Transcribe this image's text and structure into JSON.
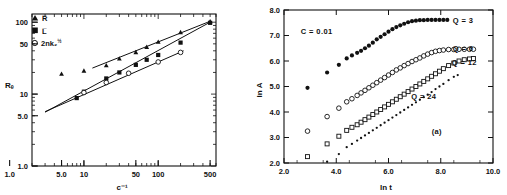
{
  "figure": {
    "background": "#ffffff",
    "ink": "#111111"
  },
  "panels": [
    {
      "id": "left",
      "name": "radius-vs-inverse-concentration",
      "chart_data": {
        "type": "scatter",
        "title": "",
        "xlabel": "c⁻¹",
        "ylabel": "Rₑ",
        "xscale": "log",
        "yscale": "log",
        "xlim": [
          2.0,
          600
        ],
        "ylim": [
          1.0,
          130
        ],
        "grid": false,
        "legend_position": "top-left",
        "xticks": [
          "1.0",
          "5.0",
          "10",
          "50",
          "100",
          "500"
        ],
        "xtick_values": [
          1.0,
          5.0,
          10,
          50,
          100,
          500
        ],
        "yticks": [
          "1.0",
          "5.0",
          "10",
          "50",
          "100"
        ],
        "ytick_values": [
          1.0,
          5.0,
          10,
          50,
          100
        ],
        "series": [
          {
            "name": "R̅",
            "marker": "filled-triangle",
            "x": [
              5.0,
              10.0,
              20.0,
              30.0,
              50.0,
              70.0,
              100.0,
              200.0,
              500.0
            ],
            "y": [
              19.0,
              21.0,
              25.0,
              31.0,
              38.0,
              45.0,
              53.0,
              72.0,
              102.0
            ],
            "fit_line": {
              "x": [
                13.0,
                500.0
              ],
              "y": [
                23.0,
                103.0
              ]
            }
          },
          {
            "name": "L̅",
            "marker": "filled-square",
            "x": [
              8.0,
              10.0,
              20.0,
              30.0,
              50.0,
              70.0,
              100.0,
              200.0,
              500.0
            ],
            "y": [
              8.8,
              10.8,
              16.5,
              20.0,
              25.5,
              30.0,
              35.0,
              52.0,
              98.0
            ],
            "fit_line": {
              "x": [
                3.0,
                500.0
              ],
              "y": [
                5.6,
                100.0
              ]
            }
          },
          {
            "name": "2nk₂",
            "name_exponent": "½",
            "marker": "open-circle",
            "x": [
              10.0,
              20.0,
              40.0,
              100.0,
              200.0
            ],
            "y": [
              10.5,
              14.5,
              19.5,
              28.0,
              38.0
            ],
            "fit_line": {
              "x": [
                3.0,
                220.0
              ],
              "y": [
                5.7,
                40.0
              ]
            }
          }
        ]
      }
    },
    {
      "id": "right",
      "name": "ln-a-vs-ln-t",
      "chart_data": {
        "type": "scatter",
        "title": "",
        "xlabel": "ln t",
        "ylabel": "ln A",
        "xscale": "linear",
        "yscale": "linear",
        "xlim": [
          2.0,
          10.0
        ],
        "ylim": [
          2.0,
          8.0
        ],
        "grid": false,
        "legend_position": "inline-right",
        "xticks": [
          "2.0",
          "4.0",
          "6.0",
          "8.0",
          "10.0"
        ],
        "xtick_values": [
          2.0,
          4.0,
          6.0,
          8.0,
          10.0
        ],
        "yticks": [
          "2.0",
          "3.0",
          "4.0",
          "5.0",
          "6.0",
          "7.0",
          "8.0"
        ],
        "ytick_values": [
          2.0,
          3.0,
          4.0,
          5.0,
          6.0,
          7.0,
          8.0
        ],
        "annotations": [
          {
            "text": "C = 0.01",
            "x": 3.25,
            "y": 7.05
          },
          {
            "text": "(a)",
            "x": 7.85,
            "y": 3.15
          }
        ],
        "series": [
          {
            "name": "Q = 3",
            "label": "Q = 3",
            "marker": "filled-circle",
            "label_x": 8.85,
            "label_y": 7.62,
            "x": [
              2.9,
              3.65,
              4.1,
              4.4,
              4.6,
              4.8,
              4.95,
              5.1,
              5.25,
              5.4,
              5.55,
              5.7,
              5.85,
              6.0,
              6.15,
              6.3,
              6.45,
              6.6,
              6.75,
              6.9,
              7.05,
              7.2,
              7.35,
              7.5,
              7.65,
              7.8,
              7.95,
              8.1,
              8.25
            ],
            "y": [
              4.95,
              5.55,
              5.85,
              6.1,
              6.22,
              6.32,
              6.4,
              6.5,
              6.6,
              6.72,
              6.85,
              6.95,
              7.05,
              7.15,
              7.25,
              7.33,
              7.4,
              7.46,
              7.52,
              7.56,
              7.58,
              7.6,
              7.6,
              7.61,
              7.61,
              7.61,
              7.61,
              7.61,
              7.61
            ]
          },
          {
            "name": "Q = 6",
            "label": "Q = 6",
            "marker": "open-circle",
            "label_x": 8.85,
            "label_y": 6.52,
            "x": [
              2.9,
              3.65,
              4.1,
              4.4,
              4.6,
              4.8,
              4.95,
              5.1,
              5.25,
              5.4,
              5.55,
              5.7,
              5.85,
              6.0,
              6.15,
              6.3,
              6.45,
              6.6,
              6.75,
              6.9,
              7.05,
              7.2,
              7.35,
              7.5,
              7.65,
              7.8,
              7.95,
              8.1,
              8.3,
              8.5,
              8.7,
              8.9,
              9.1,
              9.25
            ],
            "y": [
              3.25,
              3.82,
              4.15,
              4.4,
              4.52,
              4.65,
              4.75,
              4.85,
              4.95,
              5.05,
              5.15,
              5.25,
              5.35,
              5.45,
              5.55,
              5.65,
              5.73,
              5.82,
              5.9,
              5.98,
              6.05,
              6.12,
              6.2,
              6.27,
              6.33,
              6.38,
              6.41,
              6.43,
              6.45,
              6.45,
              6.46,
              6.46,
              6.46,
              6.46
            ]
          },
          {
            "name": "Q = 12",
            "label": "Q = 12",
            "marker": "open-square",
            "label_x": 8.9,
            "label_y": 5.95,
            "x": [
              2.9,
              3.65,
              4.1,
              4.4,
              4.6,
              4.8,
              4.95,
              5.1,
              5.25,
              5.4,
              5.55,
              5.7,
              5.85,
              6.0,
              6.15,
              6.3,
              6.45,
              6.6,
              6.75,
              6.9,
              7.05,
              7.2,
              7.35,
              7.5,
              7.65,
              7.8,
              7.95,
              8.1,
              8.3,
              8.5,
              8.7,
              8.9,
              9.1,
              9.25
            ],
            "y": [
              2.25,
              2.75,
              3.05,
              3.28,
              3.4,
              3.5,
              3.6,
              3.7,
              3.8,
              3.9,
              4.0,
              4.1,
              4.2,
              4.3,
              4.4,
              4.5,
              4.6,
              4.7,
              4.8,
              4.9,
              5.0,
              5.1,
              5.2,
              5.3,
              5.4,
              5.5,
              5.6,
              5.7,
              5.82,
              5.92,
              6.0,
              6.05,
              6.08,
              6.1
            ]
          },
          {
            "name": "Q = 24",
            "label": "Q = 24",
            "marker": "small-dot",
            "label_x": 7.35,
            "label_y": 4.62,
            "x": [
              3.65,
              4.1,
              4.4,
              4.6,
              4.8,
              4.95,
              5.1,
              5.25,
              5.4,
              5.55,
              5.7,
              5.85,
              6.0,
              6.15,
              6.3,
              6.45,
              6.6,
              6.75,
              6.9,
              7.05,
              7.2,
              7.35,
              7.5,
              7.65,
              7.8,
              7.95,
              8.1,
              8.3,
              8.5,
              8.65
            ],
            "y": [
              2.05,
              2.35,
              2.62,
              2.75,
              2.88,
              2.98,
              3.08,
              3.18,
              3.28,
              3.38,
              3.48,
              3.58,
              3.68,
              3.78,
              3.88,
              3.98,
              4.08,
              4.18,
              4.28,
              4.38,
              4.48,
              4.58,
              4.68,
              4.78,
              4.9,
              5.0,
              5.1,
              5.25,
              5.38,
              5.45
            ]
          }
        ]
      }
    }
  ]
}
